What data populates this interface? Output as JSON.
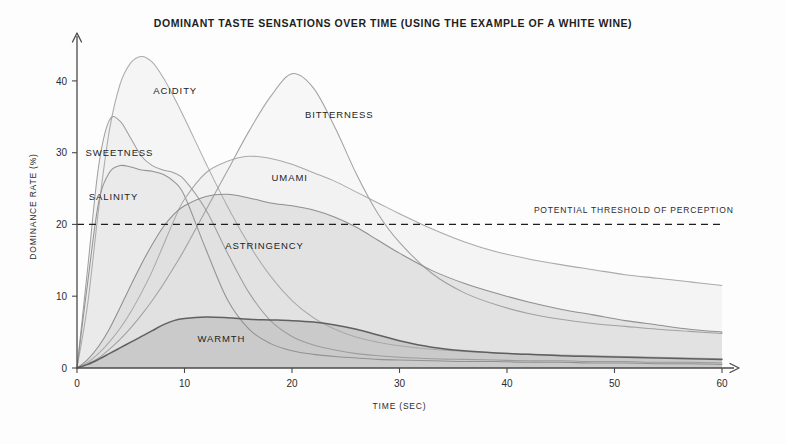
{
  "chart_data": {
    "type": "area",
    "title": "DOMINANT TASTE SENSATIONS OVER TIME (USING THE EXAMPLE OF A WHITE WINE)",
    "xlabel": "TIME (SEC)",
    "ylabel": "DOMINANCE RATE (%)",
    "xlim": [
      0,
      60
    ],
    "ylim": [
      0,
      45
    ],
    "xticks": [
      0,
      10,
      20,
      30,
      40,
      50,
      60
    ],
    "yticks": [
      0,
      10,
      20,
      30,
      40
    ],
    "grid": false,
    "legend_position": "inline-labels",
    "annotations": [
      {
        "name": "potential-threshold-of-perception",
        "text": "POTENTIAL THRESHOLD OF PERCEPTION",
        "type": "horizontal-dashed-line",
        "y": 20,
        "label_x": 42.5,
        "label_y": 21.6
      }
    ],
    "x": [
      0,
      1,
      2,
      3,
      4,
      5,
      6,
      7,
      8,
      9,
      10,
      12,
      14,
      16,
      18,
      20,
      22,
      24,
      26,
      28,
      30,
      33,
      36,
      39,
      42,
      45,
      48,
      51,
      54,
      57,
      60
    ],
    "series": [
      {
        "name": "ACIDITY",
        "label": "ACIDITY",
        "color": "#a8a8a8",
        "fill": "#f1f1f1",
        "peak_time": 6.2,
        "peak_value": 43.5,
        "label_x": 7.1,
        "label_y": 38.2,
        "values": [
          0,
          9,
          22,
          33,
          39.5,
          42.5,
          43.4,
          42.6,
          40.5,
          37.8,
          34.8,
          28.5,
          22.5,
          17.2,
          12.8,
          9.4,
          7.0,
          5.4,
          4.3,
          3.6,
          3.1,
          2.6,
          2.3,
          2.1,
          1.9,
          1.8,
          1.7,
          1.6,
          1.5,
          1.4,
          1.3
        ]
      },
      {
        "name": "SWEETNESS",
        "label": "SWEETNESS",
        "color": "#9a9a9a",
        "fill": "#ededed",
        "peak_time": 3.6,
        "peak_value": 35.0,
        "label_x": 0.8,
        "label_y": 29.6,
        "values": [
          0,
          14,
          28,
          34.5,
          34.4,
          32.0,
          29.5,
          28.2,
          27.6,
          27.2,
          26.2,
          22.0,
          16.0,
          10.5,
          6.6,
          4.4,
          3.2,
          2.5,
          2.0,
          1.7,
          1.5,
          1.3,
          1.2,
          1.1,
          1.0,
          1.0,
          0.9,
          0.9,
          0.8,
          0.8,
          0.7
        ]
      },
      {
        "name": "SALINITY",
        "label": "SALINITY",
        "color": "#8e8e8e",
        "fill": "#e6e6e6",
        "peak_time": 4.4,
        "peak_value": 28.2,
        "label_x": 1.1,
        "label_y": 23.4,
        "values": [
          0,
          12,
          23,
          27.2,
          28.2,
          28.0,
          27.6,
          27.4,
          27.0,
          26.0,
          24.0,
          16.5,
          9.5,
          5.4,
          3.4,
          2.4,
          1.9,
          1.6,
          1.4,
          1.2,
          1.1,
          1.0,
          0.9,
          0.9,
          0.8,
          0.8,
          0.7,
          0.7,
          0.6,
          0.6,
          0.5
        ]
      },
      {
        "name": "BITTERNESS",
        "label": "BITTERNESS",
        "color": "#9d9d9d",
        "fill": "#f3f3f3",
        "peak_time": 20.5,
        "peak_value": 41.2,
        "label_x": 21.2,
        "label_y": 34.8,
        "values": [
          0,
          0.6,
          1.4,
          2.6,
          4.0,
          5.6,
          7.4,
          9.4,
          11.6,
          14.0,
          16.5,
          22.0,
          27.5,
          33.0,
          37.8,
          41.0,
          39.0,
          33.5,
          27.0,
          21.5,
          17.5,
          13.2,
          10.5,
          8.8,
          7.6,
          6.8,
          6.2,
          5.8,
          5.4,
          5.1,
          4.8
        ]
      },
      {
        "name": "UMAMI",
        "label": "UMAMI",
        "color": "#a5a5a5",
        "fill": "#efefef",
        "peak_time": 16.5,
        "peak_value": 29.5,
        "label_x": 18.1,
        "label_y": 26.0,
        "values": [
          0,
          0.8,
          2.0,
          3.6,
          5.5,
          7.8,
          10.5,
          13.5,
          17.0,
          20.5,
          23.5,
          27.2,
          28.8,
          29.5,
          29.2,
          28.4,
          27.2,
          26.0,
          24.5,
          23.0,
          21.5,
          19.4,
          17.6,
          16.2,
          15.2,
          14.4,
          13.7,
          13.0,
          12.5,
          12.0,
          11.5
        ]
      },
      {
        "name": "ASTRINGENCY",
        "label": "ASTRINGENCY",
        "color": "#8a8a8a",
        "fill": "#d8d8d8",
        "peak_time": 15.0,
        "peak_value": 24.2,
        "label_x": 13.8,
        "label_y": 16.6,
        "values": [
          0,
          1.2,
          3.0,
          5.4,
          8.4,
          11.5,
          14.5,
          17.2,
          19.6,
          21.4,
          22.6,
          23.9,
          24.2,
          23.7,
          23.0,
          22.6,
          22.0,
          21.0,
          19.6,
          17.8,
          16.0,
          13.6,
          11.8,
          10.4,
          9.2,
          8.2,
          7.4,
          6.6,
          6.0,
          5.4,
          5.0
        ]
      },
      {
        "name": "WARMTH",
        "label": "WARMTH",
        "color": "#5a5a5a",
        "fill": "#bcbcbc",
        "peak_time": 11.5,
        "peak_value": 7.1,
        "label_x": 11.2,
        "label_y": 3.6,
        "values": [
          0,
          0.5,
          1.2,
          2.0,
          2.8,
          3.6,
          4.4,
          5.2,
          6.0,
          6.6,
          6.9,
          7.1,
          7.0,
          6.8,
          6.7,
          6.6,
          6.4,
          6.0,
          5.4,
          4.6,
          3.8,
          2.9,
          2.4,
          2.1,
          1.9,
          1.7,
          1.6,
          1.5,
          1.4,
          1.3,
          1.2
        ]
      }
    ]
  }
}
